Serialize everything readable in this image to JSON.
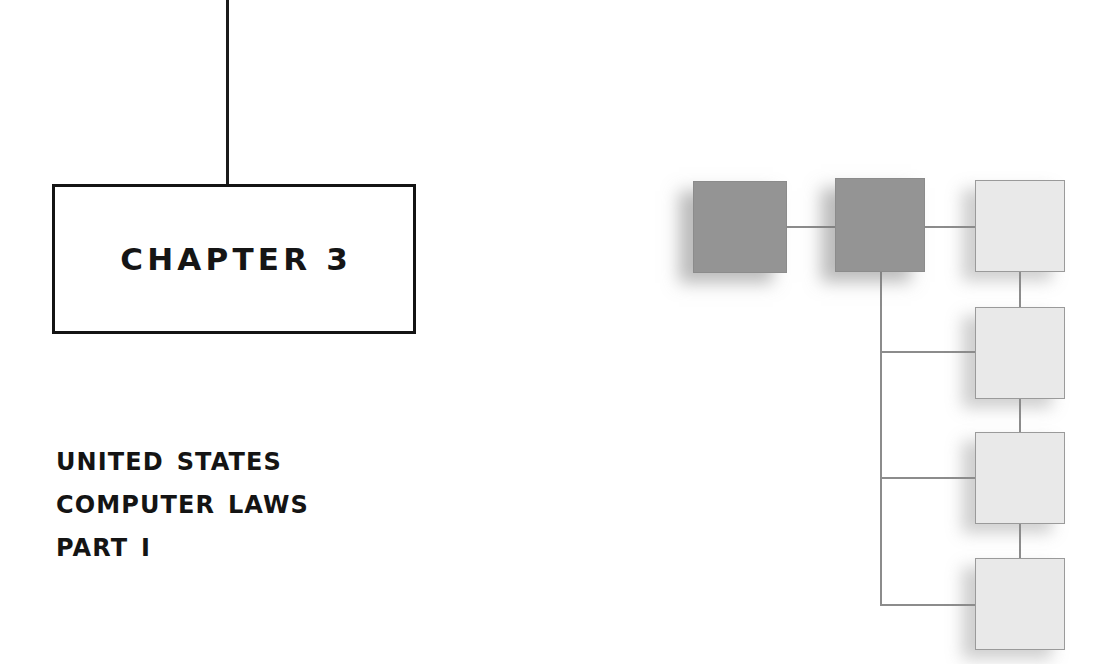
{
  "page": {
    "background_color": "#ffffff",
    "width": 1119,
    "height": 664
  },
  "chapter_marker": {
    "label": "CHAPTER 3",
    "number": "3",
    "word": "CHAPTER",
    "border_color": "#141414",
    "stem_name": "vertical-rule"
  },
  "title": {
    "line1": "United States",
    "line2": "Computer Laws",
    "line3": "Part I",
    "color": "#141414"
  },
  "diagram": {
    "name": "hierarchy-diagram",
    "dark_fill": "#949494",
    "light_fill": "#e9e9e9",
    "edge_color": "#8c8c8c",
    "nodes": [
      {
        "id": "root",
        "style": "dark",
        "x": 693,
        "y": 181,
        "w": 94,
        "h": 92
      },
      {
        "id": "branch",
        "style": "dark",
        "x": 835,
        "y": 178,
        "w": 90,
        "h": 94
      },
      {
        "id": "leaf-1",
        "style": "light",
        "x": 975,
        "y": 180,
        "w": 90,
        "h": 92
      },
      {
        "id": "leaf-2",
        "style": "light",
        "x": 975,
        "y": 307,
        "w": 90,
        "h": 92
      },
      {
        "id": "leaf-3",
        "style": "light",
        "x": 975,
        "y": 432,
        "w": 90,
        "h": 92
      },
      {
        "id": "leaf-4",
        "style": "light",
        "x": 975,
        "y": 558,
        "w": 90,
        "h": 92
      }
    ],
    "edges": [
      {
        "id": "root-to-branch",
        "orient": "h",
        "x": 787,
        "y": 226,
        "len": 48
      },
      {
        "id": "branch-to-leaf1",
        "orient": "h",
        "x": 925,
        "y": 226,
        "len": 50
      },
      {
        "id": "leaf1-to-leaf2",
        "orient": "v",
        "x": 1019,
        "y": 272,
        "len": 36
      },
      {
        "id": "leaf2-to-leaf3",
        "orient": "v",
        "x": 1019,
        "y": 398,
        "len": 35
      },
      {
        "id": "leaf3-to-leaf4",
        "orient": "v",
        "x": 1019,
        "y": 523,
        "len": 36
      },
      {
        "id": "trunk",
        "orient": "v",
        "x": 880,
        "y": 272,
        "len": 334
      },
      {
        "id": "trunk-to-leaf2",
        "orient": "h",
        "x": 880,
        "y": 351,
        "len": 96
      },
      {
        "id": "trunk-to-leaf3",
        "orient": "h",
        "x": 880,
        "y": 477,
        "len": 96
      },
      {
        "id": "trunk-to-leaf4",
        "orient": "h",
        "x": 880,
        "y": 604,
        "len": 96
      }
    ]
  }
}
